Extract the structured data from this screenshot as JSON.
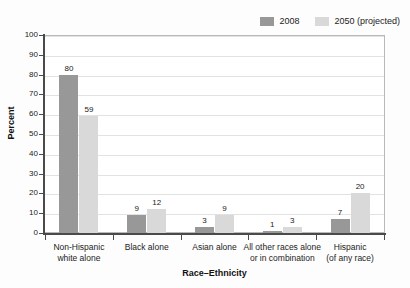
{
  "chart_data": {
    "type": "bar",
    "title": "",
    "xlabel": "Race–Ethnicity",
    "ylabel": "Percent",
    "ylim": [
      0,
      100
    ],
    "ytick_step": 10,
    "grid": true,
    "legend_position": "top-right",
    "categories": [
      "Non-Hispanic\nwhite alone",
      "Black alone",
      "Asian alone",
      "All other races alone\nor in combination",
      "Hispanic\n(of any race)"
    ],
    "category_lines": [
      [
        "Non-Hispanic",
        "white alone"
      ],
      [
        "Black alone",
        ""
      ],
      [
        "Asian alone",
        ""
      ],
      [
        "All other races alone",
        "or in combination"
      ],
      [
        "Hispanic",
        "(of any race)"
      ]
    ],
    "series": [
      {
        "name": "2008",
        "color": "#989898",
        "values": [
          80,
          9,
          3,
          1,
          7
        ]
      },
      {
        "name": "2050 (projected)",
        "color": "#d9d9d9",
        "values": [
          59,
          12,
          9,
          3,
          20
        ]
      }
    ],
    "ytick_labels": [
      "0",
      "10",
      "20",
      "30",
      "40",
      "50",
      "60",
      "70",
      "80",
      "90",
      "100"
    ]
  },
  "legend": {
    "entries": [
      {
        "label": "2008",
        "color": "#989898"
      },
      {
        "label": "2050 (projected)",
        "color": "#d9d9d9"
      }
    ]
  },
  "axes": {
    "y_title": "Percent",
    "x_title": "Race–Ethnicity"
  }
}
